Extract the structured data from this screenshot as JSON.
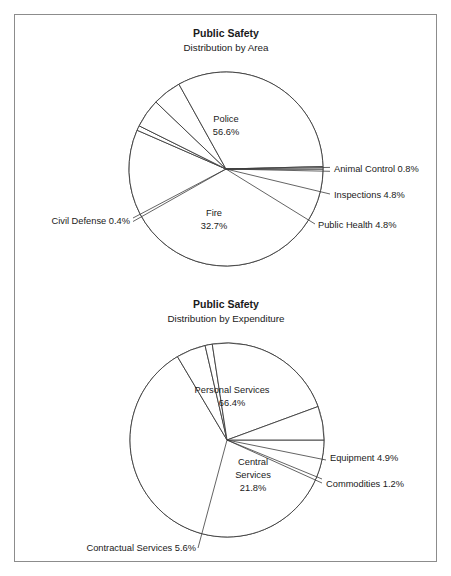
{
  "page": {
    "background": "#ffffff",
    "frame_color": "#8c8c8c",
    "line_color": "#3c3c3c",
    "text_color": "#1a1a1a"
  },
  "charts": [
    {
      "title": "Public Safety",
      "subtitle": "Distribution by Area",
      "center": {
        "x": 226,
        "y": 169
      },
      "radius": 97,
      "slices": [
        {
          "label": "Police",
          "value": 56.6,
          "label_text": "Police",
          "pct_text": "56.6%",
          "placement": "inside",
          "lx": 226,
          "ly": 120
        },
        {
          "label": "Animal Control",
          "value": 0.8,
          "label_text": "Animal Control  0.8%",
          "pct_text": "",
          "placement": "outside-right",
          "lx": 333,
          "ly": 169
        },
        {
          "label": "Inspections",
          "value": 4.8,
          "label_text": "Inspections 4.8%",
          "pct_text": "",
          "placement": "outside-right",
          "lx": 333,
          "ly": 192
        },
        {
          "label": "Public Health",
          "value": 4.8,
          "label_text": "Public Health 4.8%",
          "pct_text": "",
          "placement": "outside-right",
          "lx": 318,
          "ly": 221
        },
        {
          "label": "Fire",
          "value": 32.7,
          "label_text": "Fire",
          "pct_text": "32.7%",
          "placement": "inside",
          "lx": 214,
          "ly": 215
        },
        {
          "label": "Civil Defense",
          "value": 0.4,
          "label_text": "Civil Defense  0.4%",
          "pct_text": "",
          "placement": "outside-left",
          "lx": 128,
          "ly": 220
        }
      ]
    },
    {
      "title": "Public Safety",
      "subtitle": "Distribution by Expenditure",
      "center": {
        "x": 227,
        "y": 440
      },
      "radius": 97,
      "slices": [
        {
          "label": "Personal Services",
          "value": 66.4,
          "label_text": "Personal Services",
          "pct_text": "66.4%",
          "placement": "inside",
          "lx": 230,
          "ly": 391
        },
        {
          "label": "Equipment",
          "value": 4.9,
          "label_text": "Equipment 4.9%",
          "pct_text": "",
          "placement": "outside-right",
          "lx": 330,
          "ly": 457
        },
        {
          "label": "Commodities",
          "value": 1.2,
          "label_text": "Commodities 1.2%",
          "pct_text": "",
          "placement": "outside-right",
          "lx": 326,
          "ly": 481
        },
        {
          "label": "Central Services",
          "value": 21.8,
          "label_text": "Central",
          "pct_text": "21.8%",
          "placement": "inside-3",
          "lx": 253,
          "ly": 477,
          "label_text2": "Services"
        },
        {
          "label": "Contractual Services",
          "value": 5.6,
          "label_text": "Contractual Services 5.6%",
          "pct_text": "",
          "placement": "outside-left",
          "lx": 196,
          "ly": 546
        }
      ]
    }
  ],
  "chart_data": [
    {
      "type": "pie",
      "title": "Public Safety",
      "subtitle": "Distribution by Area",
      "categories": [
        "Police",
        "Animal Control",
        "Inspections",
        "Public Health",
        "Fire",
        "Civil Defense"
      ],
      "values": [
        56.6,
        0.8,
        4.8,
        4.8,
        32.7,
        0.4
      ],
      "unit": "%",
      "start_angle_deg": 0,
      "direction": "clockwise",
      "legend": "none",
      "labels_shown": [
        "Police 56.6%",
        "Animal Control  0.8%",
        "Inspections 4.8%",
        "Public Health 4.8%",
        "Fire 32.7%",
        "Civil Defense  0.4%"
      ]
    },
    {
      "type": "pie",
      "title": "Public Safety",
      "subtitle": "Distribution by Expenditure",
      "categories": [
        "Personal Services",
        "Equipment",
        "Commodities",
        "Central Services",
        "Contractual Services"
      ],
      "values": [
        66.4,
        4.9,
        1.2,
        21.8,
        5.6
      ],
      "unit": "%",
      "start_angle_deg": 0,
      "direction": "clockwise",
      "legend": "none",
      "labels_shown": [
        "Personal Services 66.4%",
        "Equipment 4.9%",
        "Commodities 1.2%",
        "Central Services 21.8%",
        "Contractual Services 5.6%"
      ]
    }
  ],
  "titles": {
    "chart1_title": "Public Safety",
    "chart1_subtitle": "Distribution by Area",
    "chart2_title": "Public Safety",
    "chart2_subtitle": "Distribution by Expenditure"
  },
  "labels": {
    "c1_police": "Police",
    "c1_police_pct": "56.6%",
    "c1_animal_control": "Animal Control  0.8%",
    "c1_inspections": "Inspections 4.8%",
    "c1_public_health": "Public Health 4.8%",
    "c1_fire": "Fire",
    "c1_fire_pct": "32.7%",
    "c1_civil_defense": "Civil Defense  0.4%",
    "c2_personal_services": "Personal Services",
    "c2_personal_services_pct": "66.4%",
    "c2_equipment": "Equipment 4.9%",
    "c2_commodities": "Commodities 1.2%",
    "c2_central_1": "Central",
    "c2_central_2": "Services",
    "c2_central_pct": "21.8%",
    "c2_contractual": "Contractual Services 5.6%"
  }
}
